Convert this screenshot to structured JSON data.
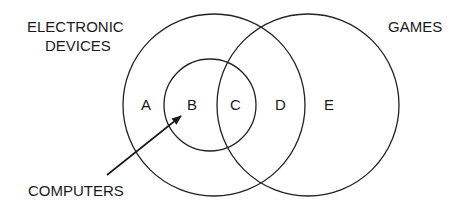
{
  "diagram": {
    "type": "venn",
    "sets": [
      {
        "name": "ELECTRONIC DEVICES",
        "label_lines": [
          "ELECTRONIC",
          "DEVICES"
        ]
      },
      {
        "name": "GAMES",
        "label_lines": [
          "GAMES"
        ]
      },
      {
        "name": "COMPUTERS",
        "label_lines": [
          "COMPUTERS"
        ]
      }
    ],
    "regions": [
      {
        "id": "A",
        "label": "A"
      },
      {
        "id": "B",
        "label": "B"
      },
      {
        "id": "C",
        "label": "C"
      },
      {
        "id": "D",
        "label": "D"
      },
      {
        "id": "E",
        "label": "E"
      }
    ],
    "stroke_color": "#222222"
  }
}
